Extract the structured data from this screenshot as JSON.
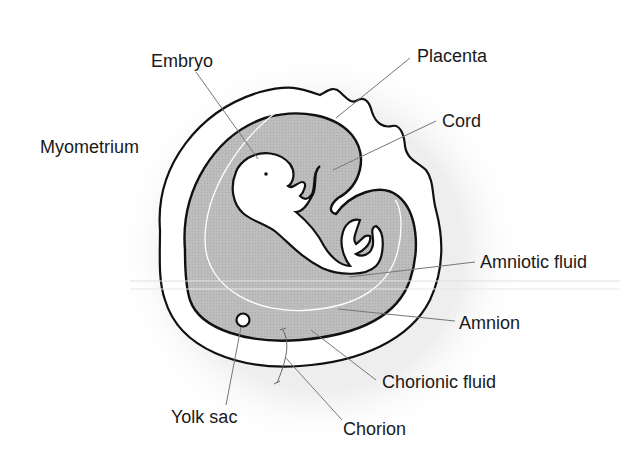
{
  "diagram": {
    "colors": {
      "background": "#ffffff",
      "halo": "#f0f0f0",
      "cavity_fill": "#b9b9b9",
      "outline": "#111111",
      "leader": "#777777",
      "amnion_line": "#ffffff",
      "text": "#1a1a1a"
    },
    "labels": {
      "embryo": "Embryo",
      "placenta": "Placenta",
      "cord": "Cord",
      "myometrium": "Myometrium",
      "amniotic_fluid": "Amniotic fluid",
      "amnion": "Amnion",
      "chorionic_fluid": "Chorionic fluid",
      "yolk_sac": "Yolk sac",
      "chorion": "Chorion"
    }
  }
}
